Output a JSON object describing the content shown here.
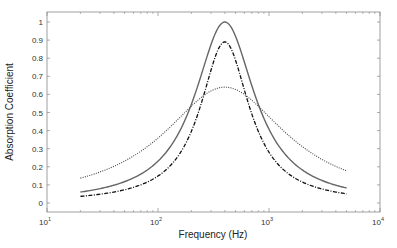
{
  "chart_data": {
    "type": "line",
    "title": "",
    "xlabel": "Frequency (Hz)",
    "ylabel": "Absorption Coefficient",
    "xscale": "log",
    "xlim": [
      10,
      10000
    ],
    "ylim": [
      -0.05,
      1.05
    ],
    "grid": false,
    "legend": null,
    "x_ticks": [
      {
        "base": "10",
        "exp": "1",
        "value": 10
      },
      {
        "base": "10",
        "exp": "2",
        "value": 100
      },
      {
        "base": "10",
        "exp": "3",
        "value": 1000
      },
      {
        "base": "10",
        "exp": "4",
        "value": 10000
      }
    ],
    "y_ticks": [
      "0",
      "0.1",
      "0.2",
      "0.3",
      "0.4",
      "0.5",
      "0.6",
      "0.7",
      "0.8",
      "0.9",
      "1"
    ],
    "x_range_of_curves_hz": [
      20,
      5000
    ],
    "series": [
      {
        "name": "solid",
        "style": "solid",
        "color": "#666666",
        "peak_frequency_hz": 400,
        "peak_value": 1.0,
        "half_width_decades": 0.33,
        "points": [
          [
            20,
            0.005
          ],
          [
            50,
            0.03
          ],
          [
            100,
            0.09
          ],
          [
            200,
            0.36
          ],
          [
            300,
            0.78
          ],
          [
            400,
            1.0
          ],
          [
            500,
            0.93
          ],
          [
            700,
            0.6
          ],
          [
            1000,
            0.3
          ],
          [
            2000,
            0.08
          ],
          [
            5000,
            0.028
          ]
        ]
      },
      {
        "name": "dash-dot",
        "style": "dashdot",
        "color": "#111111",
        "peak_frequency_hz": 400,
        "peak_value": 0.89,
        "half_width_decades": 0.27,
        "points": [
          [
            20,
            0.003
          ],
          [
            50,
            0.015
          ],
          [
            100,
            0.05
          ],
          [
            200,
            0.22
          ],
          [
            300,
            0.62
          ],
          [
            400,
            0.89
          ],
          [
            500,
            0.8
          ],
          [
            700,
            0.42
          ],
          [
            1000,
            0.18
          ],
          [
            2000,
            0.05
          ],
          [
            5000,
            0.017
          ]
        ]
      },
      {
        "name": "dotted",
        "style": "dotted",
        "color": "#444444",
        "peak_frequency_hz": 400,
        "peak_value": 0.64,
        "half_width_decades": 0.68,
        "points": [
          [
            20,
            0.02
          ],
          [
            50,
            0.1
          ],
          [
            100,
            0.25
          ],
          [
            200,
            0.5
          ],
          [
            300,
            0.61
          ],
          [
            400,
            0.64
          ],
          [
            500,
            0.63
          ],
          [
            700,
            0.57
          ],
          [
            1000,
            0.45
          ],
          [
            2000,
            0.22
          ],
          [
            5000,
            0.066
          ]
        ]
      }
    ]
  }
}
